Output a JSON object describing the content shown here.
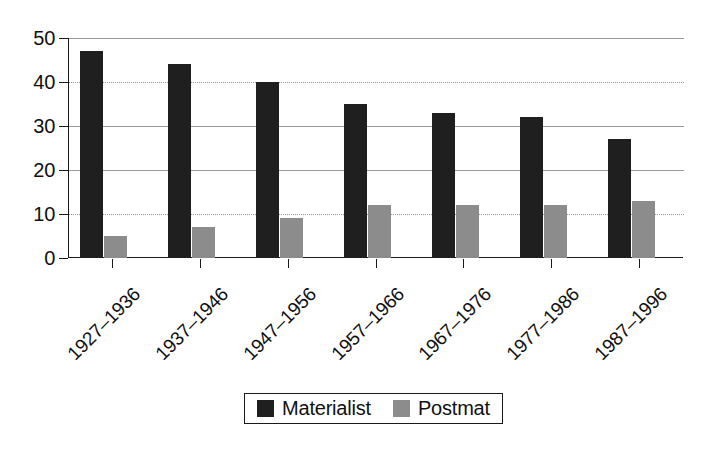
{
  "chart_data": {
    "type": "bar",
    "title": "",
    "subtitle": "",
    "xlabel": "",
    "ylabel": "",
    "ylim": [
      0,
      50
    ],
    "yticks": [
      0,
      10,
      20,
      30,
      40,
      50
    ],
    "ytick_labels": [
      "0",
      "10",
      "20",
      "30",
      "40",
      "50"
    ],
    "grid": true,
    "legend_position": "bottom-center",
    "categories": [
      "1927–1936",
      "1937–1946",
      "1947–1956",
      "1957–1966",
      "1967–1976",
      "1977–1986",
      "1987–1996"
    ],
    "series": [
      {
        "name": "Materialist",
        "color": "#1f1f1f",
        "values": [
          47,
          44,
          40,
          35,
          33,
          32,
          27
        ]
      },
      {
        "name": "Postmat",
        "color": "#8c8c8c",
        "values": [
          5,
          7,
          9,
          12,
          12,
          12,
          13
        ]
      }
    ]
  },
  "legend": {
    "entries": [
      {
        "label": "Materialist",
        "swatch": "materialist"
      },
      {
        "label": "Postmat",
        "swatch": "postmat"
      }
    ]
  },
  "colors": {
    "materialist": "#1f1f1f",
    "postmat": "#8c8c8c",
    "axis": "#1a1a1a",
    "grid": "#9a9a9a",
    "background": "#ffffff"
  }
}
